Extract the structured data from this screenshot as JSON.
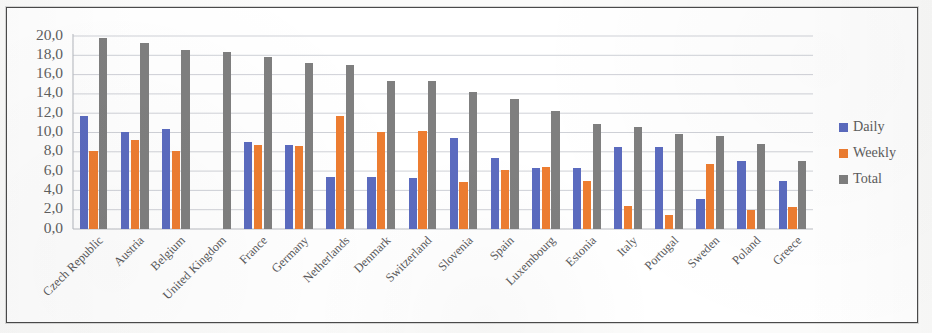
{
  "chart_data": {
    "type": "bar",
    "title": "",
    "subtitle": "",
    "xlabel": "",
    "ylabel": "",
    "ylim": [
      0,
      20
    ],
    "ytick_step": 2,
    "ytick_labels": [
      "0,0",
      "2,0",
      "4,0",
      "6,0",
      "8,0",
      "10,0",
      "12,0",
      "14,0",
      "16,0",
      "18,0",
      "20,0"
    ],
    "grid": true,
    "legend_position": "right",
    "decimal_separator": ",",
    "categories": [
      "Czech Republic",
      "Austria",
      "Belgium",
      "United Kingdom",
      "France",
      "Germany",
      "Netherlands",
      "Denmark",
      "Switzerland",
      "Slovenia",
      "Spain",
      "Luxembourg",
      "Estonia",
      "Italy",
      "Portugal",
      "Sweden",
      "Poland",
      "Greece"
    ],
    "series": [
      {
        "name": "Daily",
        "color": "#5b6bbf",
        "values": [
          11.7,
          10.1,
          10.4,
          null,
          9.0,
          8.7,
          5.4,
          5.4,
          5.3,
          9.4,
          7.4,
          6.3,
          6.3,
          8.5,
          8.5,
          3.1,
          7.0,
          5.0
        ]
      },
      {
        "name": "Weekly",
        "color": "#ed7d31",
        "values": [
          8.1,
          9.2,
          8.1,
          null,
          8.7,
          8.6,
          11.7,
          10.1,
          10.2,
          4.9,
          6.1,
          6.4,
          5.0,
          2.4,
          1.5,
          6.7,
          2.0,
          2.3
        ]
      },
      {
        "name": "Total",
        "color": "#7f7f7f",
        "values": [
          19.8,
          19.3,
          18.5,
          18.3,
          17.8,
          17.2,
          17.0,
          15.3,
          15.3,
          14.2,
          13.5,
          12.2,
          10.9,
          10.6,
          9.8,
          9.6,
          8.8,
          7.0
        ]
      }
    ]
  },
  "legend": {
    "items": [
      {
        "label": "Daily",
        "color": "#5b6bbf"
      },
      {
        "label": "Weekly",
        "color": "#ed7d31"
      },
      {
        "label": "Total",
        "color": "#7f7f7f"
      }
    ]
  }
}
